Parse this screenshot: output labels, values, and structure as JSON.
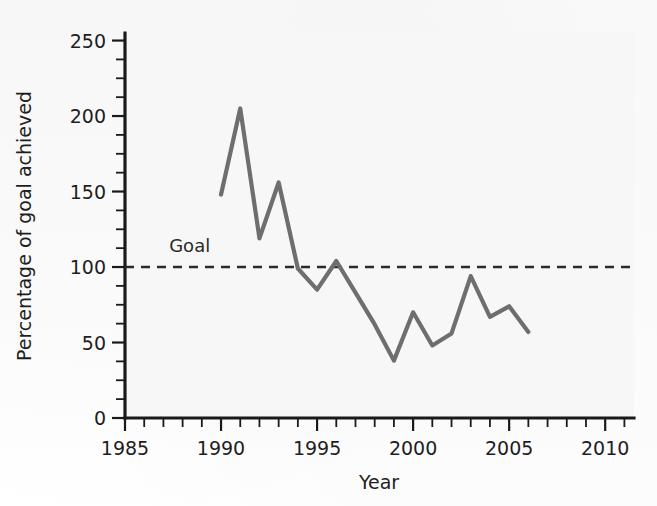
{
  "chart_data": {
    "type": "line",
    "title": "",
    "xlabel": "Year",
    "ylabel": "Percentage of goal achieved",
    "xlim": [
      1985,
      2011.5
    ],
    "ylim": [
      0,
      255
    ],
    "x_ticks_major": [
      1985,
      1990,
      1995,
      2000,
      2005,
      2010
    ],
    "x_tick_labels": [
      "1985",
      "1990",
      "1995",
      "2000",
      "2005",
      "2010"
    ],
    "x_minor_step": 1,
    "y_ticks_major": [
      0,
      50,
      100,
      150,
      200,
      250
    ],
    "y_tick_labels": [
      "0",
      "50",
      "100",
      "150",
      "200",
      "250"
    ],
    "y_minor_step": 12.5,
    "grid": false,
    "legend": "none",
    "series": [
      {
        "name": "Percentage of goal achieved",
        "color": "#6e6e6e",
        "x": [
          1990,
          1991,
          1992,
          1993,
          1994,
          1995,
          1996,
          1997,
          1998,
          1999,
          2000,
          2001,
          2002,
          2003,
          2004,
          2005,
          2006
        ],
        "values": [
          148,
          205,
          119,
          156,
          99,
          85,
          104,
          83,
          62,
          38,
          70,
          48,
          56,
          94,
          67,
          74,
          57
        ]
      }
    ],
    "annotations": [
      {
        "name": "goal-reference-line",
        "type": "hline",
        "label": "Goal",
        "y": 100,
        "x_start": 1985,
        "x_end": 2011.5,
        "style": "dashed",
        "color": "#2a2a2a",
        "label_x": 1987.3,
        "label_y": 110
      }
    ]
  },
  "axes": {
    "y_title": "Percentage of goal achieved",
    "x_title": "Year"
  }
}
